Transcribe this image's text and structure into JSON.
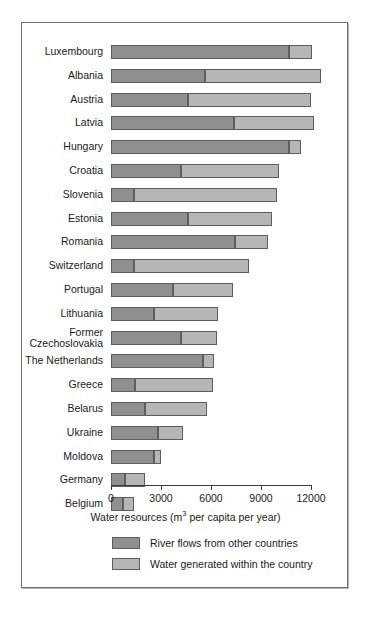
{
  "chart_data": {
    "type": "bar",
    "orientation": "horizontal",
    "stacked": true,
    "title": "",
    "xlabel": "Water resources (m3 per capita per year)",
    "xlabel_parts": {
      "pre": "Water resources (m",
      "sup": "3",
      "post": " per capita per year)"
    },
    "ylabel": "",
    "xlim": [
      0,
      12000
    ],
    "xticks": [
      0,
      3000,
      6000,
      9000,
      12000
    ],
    "xticklabels": [
      "0",
      "3000",
      "6000",
      "9000",
      "12000"
    ],
    "grid": false,
    "legend_position": "below-axis",
    "categories": [
      "Luxembourg",
      "Albania",
      "Austria",
      "Latvia",
      "Hungary",
      "Croatia",
      "Slovenia",
      "Estonia",
      "Romania",
      "Switzerland",
      "Portugal",
      "Lithuania",
      "Former\nCzechoslovakia",
      "The Netherlands",
      "Greece",
      "Belarus",
      "Ukraine",
      "Moldova",
      "Germany",
      "Belgium"
    ],
    "series": [
      {
        "name": "River flows from other countries",
        "color": "#8f8f8f",
        "values": [
          10700,
          5650,
          4600,
          7400,
          10700,
          4200,
          1400,
          4600,
          7450,
          1400,
          3700,
          2600,
          4200,
          5500,
          1450,
          2050,
          2800,
          2600,
          850,
          700
        ]
      },
      {
        "name": "Water generated within the country",
        "color": "#b6b6b6",
        "values": [
          1350,
          6950,
          7400,
          4800,
          700,
          5900,
          8550,
          5050,
          1950,
          6900,
          3600,
          3800,
          2150,
          700,
          4650,
          3700,
          1500,
          400,
          1200,
          700
        ]
      }
    ],
    "totals": [
      12050,
      12600,
      12000,
      12200,
      11400,
      10100,
      9950,
      9650,
      9400,
      8300,
      7300,
      6400,
      6350,
      6200,
      6100,
      5750,
      4300,
      3000,
      2050,
      1400
    ]
  },
  "legend": {
    "items": [
      {
        "label": "River flows from other countries",
        "swatch": "river"
      },
      {
        "label": "Water generated within the country",
        "swatch": "within"
      }
    ]
  },
  "colors": {
    "river": "#8f8f8f",
    "within": "#b6b6b6",
    "frame": "#6f6f6f",
    "text": "#1a1a1a",
    "background": "#ffffff"
  }
}
